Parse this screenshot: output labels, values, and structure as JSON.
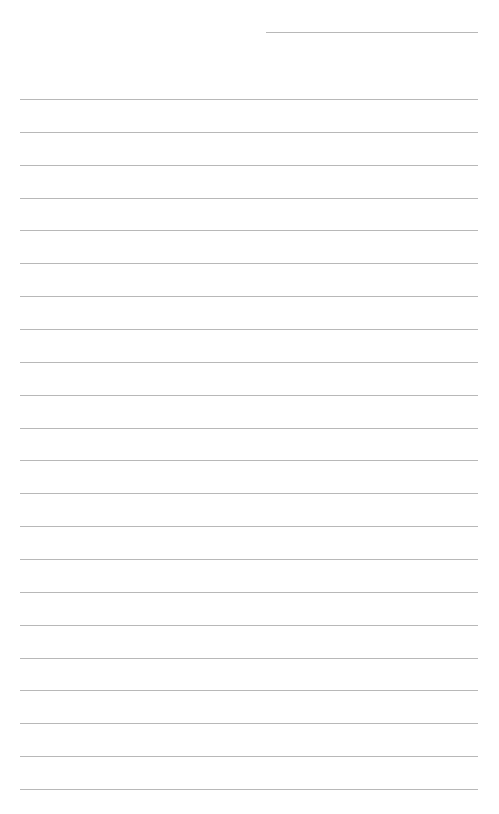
{
  "page": {
    "type": "lined-paper",
    "header_line": {
      "x": 266,
      "y": 32,
      "width": 212
    },
    "rules": {
      "count": 22,
      "start_y": 99,
      "spacing": 32.86,
      "x": 20,
      "width": 458
    },
    "line_color": "#b8b8b8",
    "background": "#ffffff"
  }
}
